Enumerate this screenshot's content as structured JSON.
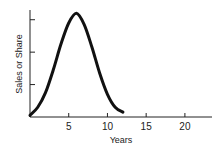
{
  "chart_data": {
    "type": "line",
    "title": "",
    "xlabel": "Years",
    "ylabel": "Sales or Share",
    "xlim": [
      0,
      23.5
    ],
    "ylim": [
      0,
      3.3
    ],
    "x_ticks": [
      5,
      10,
      15,
      20
    ],
    "x_tick_labels": [
      "5",
      "10",
      "15",
      "20"
    ],
    "y_ticks": [
      1,
      2,
      3
    ],
    "y_tick_labels": [
      "",
      "",
      ""
    ],
    "grid": false,
    "legend": null,
    "series": [
      {
        "name": "Sales or Share",
        "x": [
          0,
          1,
          2,
          3,
          4,
          5,
          6,
          7,
          8,
          9,
          10,
          11,
          12
        ],
        "y": [
          0.05,
          0.3,
          0.75,
          1.45,
          2.25,
          2.9,
          3.2,
          2.85,
          2.15,
          1.35,
          0.7,
          0.3,
          0.15
        ]
      }
    ]
  }
}
